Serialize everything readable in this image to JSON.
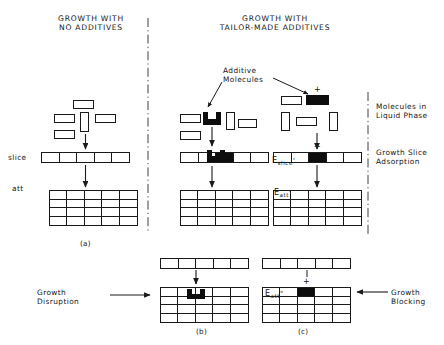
{
  "figure": {
    "titles": {
      "left": "GROWTH WITH\nNO ADDITIVES",
      "right": "GROWTH WITH\nTAILOR-MADE ADDITIVES"
    },
    "callout": "Additive\nMolecules",
    "row_labels": {
      "slice": "slice",
      "att": "att"
    },
    "phase_labels": {
      "liquid": "Molecules in\nLiquid Phase",
      "slice": "Growth Slice\nAdsorption"
    },
    "energy_labels": {
      "e_slice": "E",
      "e_slice_sub": "slice",
      "e_slice_prime": "'",
      "e_att": "E",
      "e_att_sub": "att",
      "e_att_prime": "'",
      "e_att2": "E",
      "e_att2_sub": "att",
      "e_att2_prime": "\""
    },
    "outcomes": {
      "disruption": "Growth\nDisruption",
      "blocking": "Growth\nBlocking"
    },
    "panel_captions": {
      "a": "(a)",
      "b": "(b)",
      "c": "(c)"
    },
    "plus_signs": {
      "liquid_c": "+",
      "slice_c": "+",
      "att_c": "+"
    },
    "colors": {
      "ink": "#1a1a1a",
      "fill": "#0d0d0d",
      "paper": "#ffffff"
    },
    "geometry": {
      "slice_cells": 5,
      "att_columns": 5,
      "att_rows": 4
    }
  }
}
